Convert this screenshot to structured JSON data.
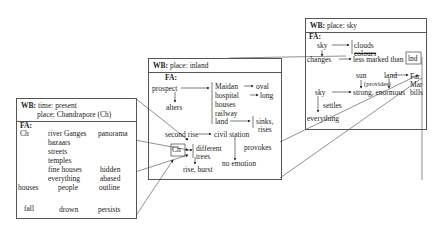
{
  "boxes": {
    "left": {
      "wb_label": "WB:",
      "wb_time": "time: present",
      "wb_place": "place: Chandrapore (Ch)",
      "fa_label": "FA:",
      "items": {
        "ch": "Ch",
        "river": "river Ganges",
        "panorama": "panorama",
        "bazaars": "bazaars",
        "streets": "streets",
        "temples": "temples",
        "fine_houses": "fine houses",
        "hidden": "hidden",
        "everything": "everything",
        "abased": "abased",
        "houses": "houses",
        "fall": "fall",
        "people": "people",
        "drown": "drown",
        "outline": "outline",
        "persists": "persists"
      }
    },
    "middle": {
      "wb_label": "WB:",
      "wb_place": "place: inland",
      "fa_label": "FA:",
      "items": {
        "prospect": "prospect",
        "alters": "alters",
        "maidan": "Maidan",
        "oval": "oval",
        "hospital": "hospital",
        "long": "long",
        "houses": "houses",
        "railway": "railway",
        "land": "land",
        "sinks": "sinks,",
        "rises": "rises",
        "second_rise": "second rise",
        "civil_station": "civil station",
        "provokes": "provokes",
        "no_emotion": "no emotion",
        "ch": "Ch",
        "different": "different",
        "trees": "trees",
        "rise_burst": "rise, burst"
      }
    },
    "right": {
      "wb_label": "WB:",
      "wb_place": "place: sky",
      "fa_label": "FA:",
      "items": {
        "sky1": "sky",
        "clouds": "clouds",
        "colours": "colours",
        "changes": "changes",
        "less_marked": "less marked than",
        "lnd": "lnd",
        "sun": "sun",
        "provides": "(provides)",
        "land": "land",
        "far": "Far",
        "mar": "Mar",
        "bills": "bills",
        "sky2": "sky",
        "strong": "strong, enormous",
        "settles": "settles",
        "everything": "everything"
      }
    }
  }
}
